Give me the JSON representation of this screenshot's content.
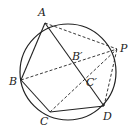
{
  "diagram": {
    "type": "geometry",
    "circle": {
      "cx": 68,
      "cy": 72,
      "r": 48
    },
    "points": {
      "A": {
        "x": 45,
        "y": 23,
        "label": "A"
      },
      "P": {
        "x": 117,
        "y": 49,
        "label": "P"
      },
      "B": {
        "x": 21,
        "y": 80,
        "label": "B"
      },
      "C": {
        "x": 50,
        "y": 112,
        "label": "C"
      },
      "D": {
        "x": 104,
        "y": 106,
        "label": "D"
      },
      "B1": {
        "x": 75,
        "y": 61,
        "label": "B′"
      },
      "C1": {
        "x": 89,
        "y": 79,
        "label": "C′"
      }
    },
    "solid_segments": [
      "AB",
      "BC",
      "CD",
      "AD"
    ],
    "dashed_segments": [
      "AP",
      "BP",
      "CP",
      "DP"
    ],
    "colors": {
      "stroke": "#222222",
      "background": "#ffffff"
    }
  }
}
